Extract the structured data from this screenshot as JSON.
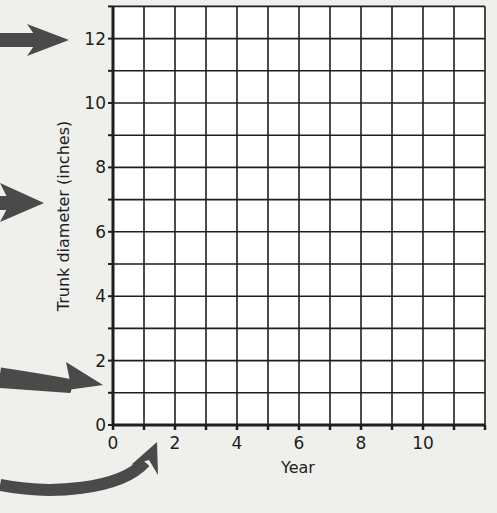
{
  "chart_data": {
    "type": "line",
    "title": "",
    "xlabel": "Year",
    "ylabel": "Trunk diameter (inches)",
    "xlim": [
      0,
      12
    ],
    "ylim": [
      0,
      13
    ],
    "x_ticks": [
      0,
      2,
      4,
      6,
      8,
      10
    ],
    "y_ticks": [
      0,
      2,
      4,
      6,
      8,
      10,
      12
    ],
    "x_minor_step": 1,
    "y_minor_step": 1,
    "grid": true,
    "series": [],
    "annotations": [
      {
        "type": "arrow",
        "target": "y-axis label 12",
        "direction": "right"
      },
      {
        "type": "arrow",
        "target": "y-axis title",
        "direction": "right"
      },
      {
        "type": "arrow",
        "target": "y-axis tick 1",
        "direction": "down-right"
      },
      {
        "type": "arrow",
        "target": "x-axis tick 1",
        "direction": "curved-up"
      }
    ],
    "legend": null,
    "note": "Blank grid with no plotted data points"
  },
  "axes": {
    "x_label": "Year",
    "y_label": "Trunk diameter (inches)",
    "x_tick_labels": [
      "0",
      "2",
      "4",
      "6",
      "8",
      "10"
    ],
    "y_tick_labels": [
      "0",
      "2",
      "4",
      "6",
      "8",
      "10",
      "12"
    ]
  },
  "colors": {
    "background": "#efefec",
    "plot_area": "#ffffff",
    "grid": "#1e1e1e",
    "arrow": "#4a4a4a"
  }
}
